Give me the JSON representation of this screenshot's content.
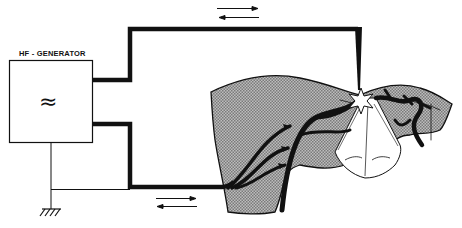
{
  "diagram": {
    "generator": {
      "label": "HF - GENERATOR",
      "symbol": "≈"
    },
    "elements": [
      {
        "name": "hf-generator-box",
        "type": "box"
      },
      {
        "name": "active-electrode-wire",
        "type": "thick-line"
      },
      {
        "name": "return-electrode-wire",
        "type": "thick-line"
      },
      {
        "name": "active-electrode-tip",
        "type": "needle"
      },
      {
        "name": "spark-star",
        "type": "star"
      },
      {
        "name": "ground-symbol",
        "type": "earth"
      },
      {
        "name": "tissue-body",
        "type": "hatched-region"
      },
      {
        "name": "current-arrows-top",
        "type": "bidirectional-arrow"
      },
      {
        "name": "current-arrows-bottom",
        "type": "bidirectional-arrow"
      }
    ],
    "colors": {
      "ink": "#111111",
      "tissue": "#a8a8a8",
      "background": "#ffffff"
    }
  }
}
